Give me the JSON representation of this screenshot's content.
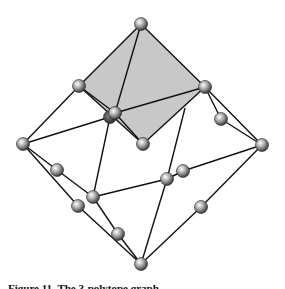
{
  "figure": {
    "type": "polyhedral-graph",
    "shaded_face_color": "#c8c8c8",
    "edge_color": "#111111",
    "node_style": "shaded-sphere",
    "nodes": [
      {
        "id": "top"
      },
      {
        "id": "diamond-left"
      },
      {
        "id": "diamond-right"
      },
      {
        "id": "center-back"
      },
      {
        "id": "center-front"
      },
      {
        "id": "diamond-bottom"
      },
      {
        "id": "right-upper-mid"
      },
      {
        "id": "far-left"
      },
      {
        "id": "far-right"
      },
      {
        "id": "left-mid-a"
      },
      {
        "id": "inner-left"
      },
      {
        "id": "left-mid-b"
      },
      {
        "id": "lower-left-mid"
      },
      {
        "id": "inner-right-a"
      },
      {
        "id": "inner-right-b"
      },
      {
        "id": "right-lower-mid"
      },
      {
        "id": "bottom"
      }
    ],
    "shaded_face": [
      "top",
      "diamond-left",
      "diamond-bottom",
      "diamond-right"
    ],
    "edges": [
      [
        "top",
        "diamond-left"
      ],
      [
        "top",
        "diamond-right"
      ],
      [
        "top",
        "center-front"
      ],
      [
        "diamond-left",
        "center-front"
      ],
      [
        "diamond-left",
        "diamond-bottom"
      ],
      [
        "diamond-left",
        "far-left"
      ],
      [
        "center-front",
        "diamond-right"
      ],
      [
        "center-front",
        "diamond-bottom"
      ],
      [
        "diamond-right",
        "diamond-bottom"
      ],
      [
        "diamond-right",
        "right-upper-mid"
      ],
      [
        "right-upper-mid",
        "far-right"
      ],
      [
        "diamond-right",
        "far-right"
      ],
      [
        "far-left",
        "center-back"
      ],
      [
        "far-left",
        "left-mid-a"
      ],
      [
        "left-mid-a",
        "inner-left"
      ],
      [
        "far-left",
        "left-mid-b"
      ],
      [
        "left-mid-b",
        "bottom"
      ],
      [
        "center-back",
        "inner-left"
      ],
      [
        "inner-left",
        "lower-left-mid"
      ],
      [
        "lower-left-mid",
        "bottom"
      ],
      [
        "inner-left",
        "inner-right-a"
      ],
      [
        "inner-right-a",
        "inner-right-b"
      ],
      [
        "inner-right-b",
        "far-right"
      ],
      [
        "diamond-right-edge-point",
        "inner-right-a"
      ],
      [
        "inner-right-a",
        "bottom"
      ],
      [
        "far-right",
        "right-lower-mid"
      ],
      [
        "right-lower-mid",
        "bottom"
      ]
    ]
  },
  "caption": "Figure 11. The 3-polytope graph ..."
}
